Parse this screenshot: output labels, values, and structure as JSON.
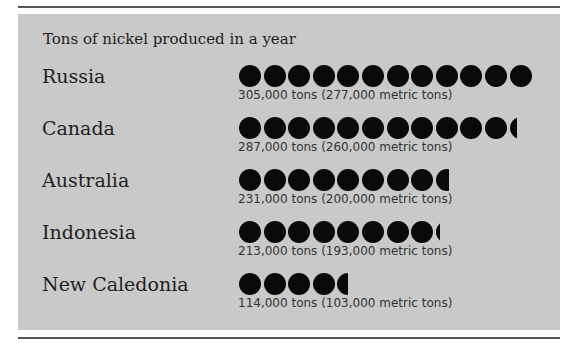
{
  "chart_data": {
    "type": "bar",
    "title": "Tons of nickel produced in a year",
    "xlabel": "",
    "ylabel": "",
    "unit_symbol": "filled circle (approx. 25,000 tons each)",
    "categories": [
      "Russia",
      "Canada",
      "Australia",
      "Indonesia",
      "New Caledonia"
    ],
    "series": [
      {
        "name": "Tons",
        "values": [
          305000,
          287000,
          231000,
          213000,
          114000
        ]
      },
      {
        "name": "Metric tons",
        "values": [
          277000,
          260000,
          200000,
          193000,
          103000
        ]
      }
    ],
    "symbol_counts": [
      12,
      11.3,
      8.6,
      8.2,
      4.5
    ]
  },
  "title": "Tons of nickel produced in a year",
  "rows": [
    {
      "country": "Russia",
      "full": 12,
      "partial": 0,
      "amount": "305,000 tons (277,000 metric tons)"
    },
    {
      "country": "Canada",
      "full": 11,
      "partial": 0.3,
      "amount": "287,000 tons (260,000 metric tons)"
    },
    {
      "country": "Australia",
      "full": 8,
      "partial": 0.6,
      "amount": "231,000 tons (200,000 metric tons)"
    },
    {
      "country": "Indonesia",
      "full": 8,
      "partial": 0.2,
      "amount": "213,000 tons (193,000 metric tons)"
    },
    {
      "country": "New Caledonia",
      "full": 4,
      "partial": 0.5,
      "amount": "114,000 tons (103,000 metric tons)"
    }
  ],
  "colors": {
    "panel": "#c9c9c9",
    "dot": "#0a0a0a",
    "rule": "#555555"
  }
}
